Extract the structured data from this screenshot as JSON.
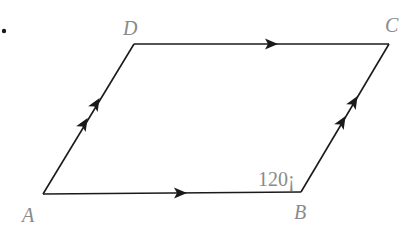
{
  "diagram": {
    "type": "parallelogram",
    "vertices": [
      {
        "name": "A",
        "x": 43,
        "y": 194
      },
      {
        "name": "B",
        "x": 301,
        "y": 192
      },
      {
        "name": "C",
        "x": 389,
        "y": 44
      },
      {
        "name": "D",
        "x": 134,
        "y": 44
      }
    ],
    "labels": {
      "A": "A",
      "B": "B",
      "C": "C",
      "D": "D"
    },
    "angle_label": "120¡",
    "angle_vertex": "B",
    "edges": [
      {
        "from": "A",
        "to": "B",
        "arrows": 1
      },
      {
        "from": "D",
        "to": "C",
        "arrows": 1
      },
      {
        "from": "A",
        "to": "D",
        "arrows": 2
      },
      {
        "from": "B",
        "to": "C",
        "arrows": 2
      }
    ],
    "line_color": "#1a1a1a",
    "label_color": "#8a8a8a"
  }
}
